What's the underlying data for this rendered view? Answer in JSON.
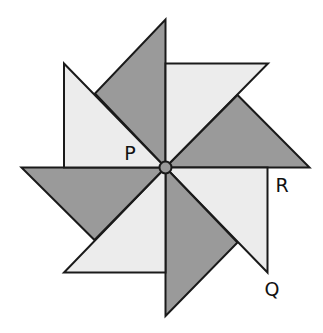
{
  "diagram": {
    "colors": {
      "light": "#ececec",
      "dark": "#9a9a9a",
      "stroke": "#1a1a1a",
      "background": "#ffffff"
    },
    "center": {
      "x": 165.5,
      "y": 167.5,
      "r": 6
    },
    "labels": [
      {
        "id": "P",
        "text": "P",
        "x": 130,
        "y": 160
      },
      {
        "id": "R",
        "text": "R",
        "x": 282,
        "y": 192
      },
      {
        "id": "Q",
        "text": "Q",
        "x": 272,
        "y": 296
      }
    ],
    "triangles": [
      {
        "name": "top-dark",
        "fill": "dark",
        "points": "165.5,167.5 165.5,19.5 95,93.5"
      },
      {
        "name": "top-right-light",
        "fill": "light",
        "points": "165.5,167.5 165.5,63.5 268,63.5"
      },
      {
        "name": "right-dark",
        "fill": "dark",
        "points": "165.5,167.5 237.5,95 309.5,167.5"
      },
      {
        "name": "right-bottom-light",
        "fill": "light",
        "points": "165.5,167.5 267.5,167.5 267.5,272.5"
      },
      {
        "name": "bottom-dark",
        "fill": "dark",
        "points": "165.5,167.5 165.5,316 237.5,242.5"
      },
      {
        "name": "bottom-left-light",
        "fill": "light",
        "points": "165.5,167.5 165.5,272.5 64,272.5"
      },
      {
        "name": "left-dark",
        "fill": "dark",
        "points": "165.5,167.5 94.5,240 21.5,167.5"
      },
      {
        "name": "left-top-light",
        "fill": "light",
        "points": "165.5,167.5 64,167.5 64,63.5"
      }
    ]
  }
}
